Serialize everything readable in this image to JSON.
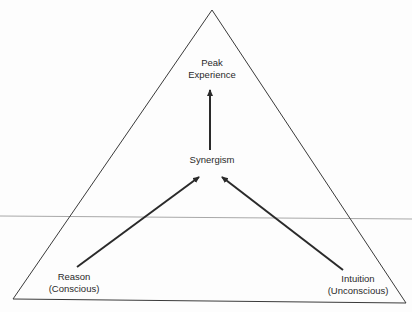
{
  "diagram": {
    "type": "triangle-flow",
    "nodes": {
      "peak": {
        "line1": "Peak",
        "line2": "Experience"
      },
      "synergism": {
        "label": "Synergism"
      },
      "reason": {
        "line1": "Reason",
        "line2": "(Conscious)"
      },
      "intuition": {
        "line1": "Intuition",
        "line2": "(Unconscious)"
      }
    },
    "edges": [
      {
        "from": "reason",
        "to": "synergism"
      },
      {
        "from": "intuition",
        "to": "synergism"
      },
      {
        "from": "synergism",
        "to": "peak"
      }
    ],
    "colors": {
      "stroke": "#2a2a2a",
      "divider": "#a8a8a8"
    }
  }
}
